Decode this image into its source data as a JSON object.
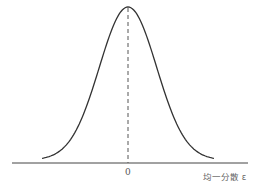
{
  "chart_data": {
    "type": "line",
    "title": "",
    "xlabel": "均一分散 ε",
    "ylabel": "",
    "x_ticks": [
      "0"
    ],
    "grid": false,
    "legend": null,
    "series": [
      {
        "name": "bell curve (normal distribution)",
        "shape": "gaussian",
        "center": 0,
        "x": [
          -3,
          -2.5,
          -2,
          -1.5,
          -1,
          -0.5,
          0,
          0.5,
          1,
          1.5,
          2,
          2.5,
          3
        ],
        "values": [
          0.011,
          0.044,
          0.135,
          0.325,
          0.607,
          0.882,
          1.0,
          0.882,
          0.607,
          0.325,
          0.135,
          0.044,
          0.011
        ]
      }
    ],
    "annotations": [
      {
        "type": "dashed-vertical-line",
        "x": 0,
        "description": "mean marker from peak to axis"
      }
    ],
    "colors": {
      "curve": "#333333",
      "axis": "#444444",
      "dashed": "#555555"
    }
  },
  "labels": {
    "zero_tick": "0",
    "x_axis": "均一分散 ε"
  }
}
